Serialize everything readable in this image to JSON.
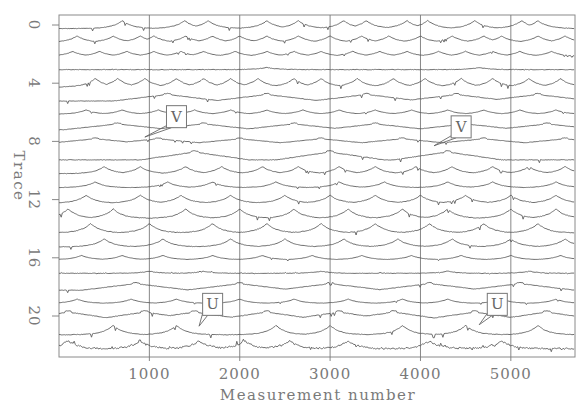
{
  "chart_data": {
    "type": "line",
    "title": "",
    "xlabel": "Measurement number",
    "ylabel": "Trace",
    "xlim": [
      0,
      5710
    ],
    "ylim": [
      22.5,
      -0.5
    ],
    "x_ticks": [
      1000,
      2000,
      3000,
      4000,
      5000
    ],
    "x_tick_labels": [
      "1000",
      "2000",
      "3000",
      "4000",
      "5000"
    ],
    "y_ticks": [
      0,
      4,
      8,
      12,
      16,
      20
    ],
    "y_tick_labels": [
      "0",
      "4",
      "8",
      "12",
      "16",
      "20"
    ],
    "grid": {
      "x": true,
      "y": false
    },
    "legend": null,
    "series_count": 23,
    "series_description": "Stacked waveform traces 0-22 (offset vertically), each showing a series of cusp-shaped peaks over ~5700 measurements",
    "series": [
      {
        "name": "Trace 0",
        "peaks": [
          700,
          1390,
          1650,
          2300,
          2650,
          3150,
          3400,
          3850,
          4080,
          4600,
          5120,
          5300
        ],
        "amp": 0.55
      },
      {
        "name": "Trace 1",
        "peaks": [
          200,
          600,
          900,
          1050,
          1400,
          1700,
          2000,
          2300,
          2650,
          3000,
          3350,
          3650,
          4000,
          4350,
          4700,
          4900,
          5300,
          5600
        ],
        "amp": 0.45
      },
      {
        "name": "Trace 2",
        "peaks": [
          150,
          450,
          750,
          1050,
          1350,
          1600,
          1950,
          2300,
          2600,
          2900,
          3250,
          3550,
          3850,
          4200,
          4500,
          4800,
          5100,
          5450
        ],
        "amp": 0.35
      },
      {
        "name": "Trace 3",
        "peaks": [
          2300,
          4650
        ],
        "amp": 0.15,
        "noise": true
      },
      {
        "name": "Trace 4",
        "peaks": [
          400,
          650,
          950,
          1300,
          1600,
          1900,
          2200,
          2600,
          2900,
          3300,
          3700,
          4050,
          4450,
          4800,
          5200,
          5550
        ],
        "amp": 0.6
      },
      {
        "name": "Trace 5",
        "peaks": [
          1200,
          2300,
          3400,
          4400,
          5300
        ],
        "amp": 0.5,
        "shape": "tri"
      },
      {
        "name": "Trace 6",
        "peaks": [
          300,
          700,
          1100,
          1500,
          1900,
          2300,
          2700,
          3100,
          3500,
          3900,
          4300,
          4700,
          5100,
          5500
        ],
        "amp": 0.3
      },
      {
        "name": "Trace 7",
        "peaks": [
          650,
          1600,
          2600,
          3500,
          4500,
          5400
        ],
        "amp": 0.45,
        "shape": "tri"
      },
      {
        "name": "Trace 8",
        "peaks": [
          400,
          1100,
          2000,
          2900,
          3800,
          4700,
          5600
        ],
        "amp": 0.4,
        "shape": "tri"
      },
      {
        "name": "Trace 9",
        "peaks": [
          1500,
          3000,
          4300
        ],
        "amp": 0.6,
        "shape": "tri"
      },
      {
        "name": "Trace 10",
        "peaks": [
          500,
          900,
          1400,
          1800,
          2250,
          2650,
          3100,
          3500,
          3950,
          4350,
          4800,
          5200,
          5600
        ],
        "amp": 0.5
      },
      {
        "name": "Trace 11",
        "peaks": [
          400,
          1200,
          1700,
          2400,
          3100,
          3600,
          4300,
          4800,
          5500
        ],
        "amp": 0.4
      },
      {
        "name": "Trace 12",
        "peaks": [
          300,
          900,
          1350,
          1900,
          2500,
          3000,
          3500,
          4000,
          4500,
          5000,
          5500
        ],
        "amp": 0.55
      },
      {
        "name": "Trace 13",
        "peaks": [
          100,
          600,
          1400,
          2000,
          2600,
          3200,
          3800,
          4300,
          5000,
          5500
        ],
        "amp": 0.65
      },
      {
        "name": "Trace 14",
        "peaks": [
          350,
          1000,
          1700,
          2300,
          2900,
          3500,
          4100,
          4700,
          5300
        ],
        "amp": 0.65
      },
      {
        "name": "Trace 15",
        "peaks": [
          500,
          1150,
          1900,
          2500,
          3150,
          3750,
          4350,
          5000,
          5600
        ],
        "amp": 0.55
      },
      {
        "name": "Trace 16",
        "peaks": [
          250,
          700,
          1150,
          1700,
          2250,
          2800,
          3350,
          3900,
          4450,
          5000,
          5550
        ],
        "amp": 0.3
      },
      {
        "name": "Trace 17",
        "peaks": [
          1000,
          1600,
          2900,
          4300,
          5200
        ],
        "amp": 0.15,
        "noise": true
      },
      {
        "name": "Trace 18",
        "peaks": [
          850,
          2000,
          3000,
          4100,
          5100
        ],
        "amp": 0.5,
        "shape": "tri"
      },
      {
        "name": "Trace 19",
        "peaks": [
          200,
          800,
          1300,
          2000,
          2600,
          3200,
          3800,
          4300,
          4900,
          5500
        ],
        "amp": 0.3
      },
      {
        "name": "Trace 20",
        "peaks": [
          100,
          950,
          1500,
          2300,
          3100,
          3700,
          4600,
          5400
        ],
        "amp": 0.6,
        "shape": "tri"
      },
      {
        "name": "Trace 21",
        "peaks": [
          600,
          1300,
          2400,
          3000,
          3800,
          4500,
          5300
        ],
        "amp": 0.65
      },
      {
        "name": "Trace 22",
        "peaks": [
          100,
          900,
          1550,
          2050,
          2550,
          3200,
          4100,
          4900
        ],
        "amp": 0.55,
        "noise": true
      }
    ],
    "annotations": [
      {
        "label": "V",
        "box_x": 1300,
        "box_trace": 6.3,
        "arrow_to_x": 950,
        "arrow_to_trace": 7.7
      },
      {
        "label": "V",
        "box_x": 4450,
        "box_trace": 7.0,
        "arrow_to_x": 4150,
        "arrow_to_trace": 8.3
      },
      {
        "label": "U",
        "box_x": 1700,
        "box_trace": 19.2,
        "arrow_to_x": 1550,
        "arrow_to_trace": 20.7
      },
      {
        "label": "U",
        "box_x": 4850,
        "box_trace": 19.2,
        "arrow_to_x": 4650,
        "arrow_to_trace": 20.6
      }
    ]
  },
  "colors": {
    "trace": "#5f5f5f",
    "frame": "#8a8a8a",
    "grid": "#7a7a7a",
    "text": "#7a7a7a"
  }
}
